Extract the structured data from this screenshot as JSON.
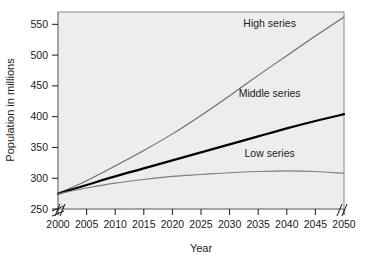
{
  "chart_data": {
    "type": "line",
    "title": "",
    "subtitle": "",
    "xlabel": "Year",
    "ylabel": "Population in millions",
    "xlim": [
      2000,
      2050
    ],
    "ylim": [
      250,
      570
    ],
    "grid": false,
    "legend_position": "inline-end-of-series",
    "axis_breaks": {
      "y_axis_break_below": 250,
      "x_axis_break_left": true,
      "x_axis_break_right": true
    },
    "x_ticks": [
      "2000",
      "2005",
      "2010",
      "2015",
      "2020",
      "2025",
      "2030",
      "2035",
      "2040",
      "2045",
      "2050"
    ],
    "y_ticks": [
      "250",
      "300",
      "350",
      "400",
      "450",
      "500",
      "550"
    ],
    "x": [
      2000,
      2005,
      2010,
      2015,
      2020,
      2025,
      2030,
      2035,
      2040,
      2045,
      2050
    ],
    "series": [
      {
        "name": "High series",
        "color": "#6b6b6b",
        "width": 1.1,
        "values": [
          275,
          296,
          320,
          345,
          372,
          402,
          434,
          467,
          499,
          531,
          562
        ]
      },
      {
        "name": "Middle series",
        "color": "#000000",
        "width": 2.2,
        "values": [
          275,
          289,
          303,
          316,
          329,
          342,
          355,
          368,
          381,
          393,
          404
        ]
      },
      {
        "name": "Low series",
        "color": "#7d7d7d",
        "width": 1.1,
        "values": [
          275,
          284,
          292,
          298,
          303,
          306,
          309,
          311,
          312,
          311,
          308
        ]
      }
    ],
    "annotations": [
      {
        "text": "High series",
        "x": 2037,
        "y": 545
      },
      {
        "text": "Middle series",
        "x": 2037,
        "y": 432
      },
      {
        "text": "Low series",
        "x": 2037,
        "y": 335
      }
    ]
  },
  "colors": {
    "plot_background": "#ededed",
    "plot_border": "#8a8a8a",
    "page_background": "#ffffff",
    "text": "#1a1a1a",
    "high_series": "#6b6b6b",
    "middle_series": "#000000",
    "low_series": "#7d7d7d"
  }
}
